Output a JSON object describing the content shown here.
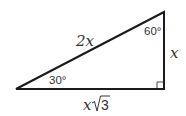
{
  "diagram": {
    "type": "right-triangle-30-60-90",
    "stroke_color": "#1a1a1a",
    "label_color": "#333333",
    "labels": {
      "hypotenuse": "2x",
      "top_angle": "60°",
      "vertical_side": "x",
      "bottom_angle": "30°",
      "base": "x√3",
      "base_x": "x",
      "base_root": "3"
    }
  }
}
